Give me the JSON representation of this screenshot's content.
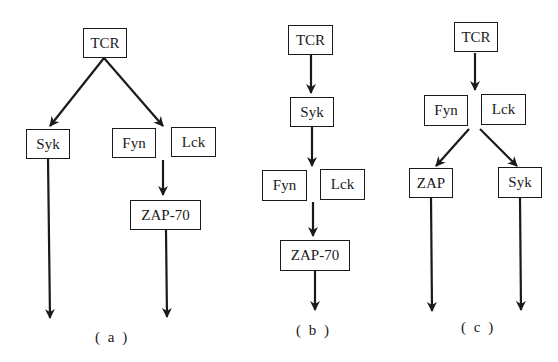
{
  "diagram": {
    "style": {
      "stroke": "#1a1a1a",
      "background": "#ffffff",
      "node_border": "#1a1a1a"
    },
    "panels": [
      {
        "id": "a",
        "caption": "( a )",
        "nodes": {
          "tcr": "TCR",
          "syk": "Syk",
          "fyn": "Fyn",
          "lck": "Lck",
          "zap": "ZAP-70"
        },
        "edges": [
          [
            "TCR",
            "Syk"
          ],
          [
            "TCR",
            "Fyn/Lck"
          ],
          [
            "Fyn/Lck",
            "ZAP-70"
          ],
          [
            "Syk",
            "downstream"
          ],
          [
            "ZAP-70",
            "downstream"
          ]
        ]
      },
      {
        "id": "b",
        "caption": "( b )",
        "nodes": {
          "tcr": "TCR",
          "syk": "Syk",
          "fyn": "Fyn",
          "lck": "Lck",
          "zap": "ZAP-70"
        },
        "edges": [
          [
            "TCR",
            "Syk"
          ],
          [
            "Syk",
            "Fyn/Lck"
          ],
          [
            "Fyn/Lck",
            "ZAP-70"
          ],
          [
            "ZAP-70",
            "downstream"
          ]
        ]
      },
      {
        "id": "c",
        "caption": "( c )",
        "nodes": {
          "tcr": "TCR",
          "fyn": "Fyn",
          "lck": "Lck",
          "zap": "ZAP",
          "syk": "Syk"
        },
        "edges": [
          [
            "TCR",
            "Fyn/Lck"
          ],
          [
            "Fyn/Lck",
            "ZAP"
          ],
          [
            "Fyn/Lck",
            "Syk"
          ],
          [
            "ZAP",
            "downstream"
          ],
          [
            "Syk",
            "downstream"
          ]
        ]
      }
    ]
  }
}
